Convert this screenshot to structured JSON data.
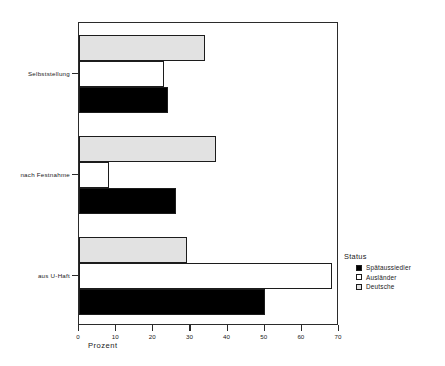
{
  "chart_data": {
    "type": "bar",
    "orientation": "horizontal",
    "title": "",
    "xlabel": "Prozent",
    "ylabel": "",
    "xlim": [
      0,
      70
    ],
    "xticks": [
      0,
      10,
      20,
      30,
      40,
      50,
      60,
      70
    ],
    "grid": false,
    "categories": [
      "Selbststellung",
      "nach Festnahme",
      "aus U-Haft"
    ],
    "series": [
      {
        "name": "Spätaussiedler",
        "color": "#000000",
        "values": [
          24,
          26,
          50
        ]
      },
      {
        "name": "Ausländer",
        "color": "#ffffff",
        "values": [
          23,
          8,
          68
        ]
      },
      {
        "name": "Deutsche",
        "color": "#e2e2e2",
        "values": [
          34,
          37,
          29
        ]
      }
    ],
    "legend": {
      "title": "Status",
      "position": "right",
      "entries": [
        {
          "label": "Spätaussiedler",
          "color": "#000000"
        },
        {
          "label": "Ausländer",
          "color": "#ffffff"
        },
        {
          "label": "Deutsche",
          "color": "#e2e2e2"
        }
      ]
    }
  },
  "axis": {
    "x_title": "Prozent",
    "x_tick_labels": [
      "0",
      "10",
      "20",
      "30",
      "40",
      "50",
      "60",
      "70"
    ],
    "y_tick_labels": [
      "Selbststellung",
      "nach Festnahme",
      "aus U-Haft"
    ]
  },
  "legend": {
    "title": "Status",
    "items": [
      {
        "label": "Spätaussiedler"
      },
      {
        "label": "Ausländer"
      },
      {
        "label": "Deutsche"
      }
    ]
  },
  "colors": {
    "spaetaussiedler": "#000000",
    "auslaender": "#ffffff",
    "deutsche": "#e2e2e2",
    "outline": "#1c1c1c",
    "frame": "#2b2b2b"
  }
}
